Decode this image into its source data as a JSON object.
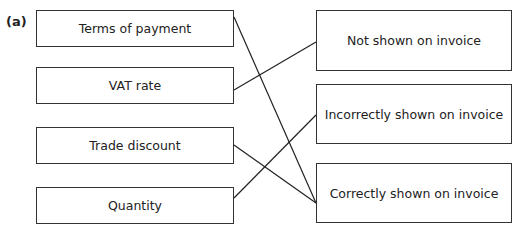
{
  "part_label": "(a)",
  "left_items": [
    "Terms of payment",
    "VAT rate",
    "Trade discount",
    "Quantity"
  ],
  "right_items": [
    "Not shown on invoice",
    "Incorrectly shown on invoice",
    "Correctly shown on invoice"
  ],
  "connections": [
    {
      "from": "Terms of payment",
      "to": "Correctly shown on invoice"
    },
    {
      "from": "VAT rate",
      "to": "Not shown on invoice"
    },
    {
      "from": "Trade discount",
      "to": "Correctly shown on invoice"
    },
    {
      "from": "Quantity",
      "to": "Incorrectly shown on invoice"
    }
  ]
}
